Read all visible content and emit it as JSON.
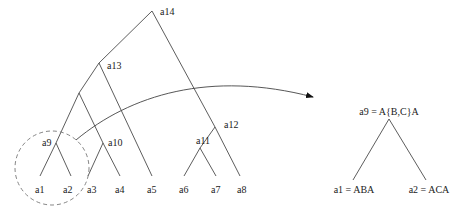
{
  "tree": {
    "internal_nodes": [
      {
        "id": "a14",
        "label": "a14"
      },
      {
        "id": "a13",
        "label": "a13"
      },
      {
        "id": "a12",
        "label": "a12"
      },
      {
        "id": "a11",
        "label": "a11"
      },
      {
        "id": "a10",
        "label": "a10"
      },
      {
        "id": "a9",
        "label": "a9"
      }
    ],
    "leaves": [
      {
        "id": "a1",
        "label": "a1"
      },
      {
        "id": "a2",
        "label": "a2"
      },
      {
        "id": "a3",
        "label": "a3"
      },
      {
        "id": "a4",
        "label": "a4"
      },
      {
        "id": "a5",
        "label": "a5"
      },
      {
        "id": "a6",
        "label": "a6"
      },
      {
        "id": "a7",
        "label": "a7"
      },
      {
        "id": "a8",
        "label": "a8"
      }
    ]
  },
  "detail": {
    "root_label": "a9 = A{B,C}A",
    "left_label": "a1 = ABA",
    "right_label": "a2 = ACA"
  },
  "colors": {
    "line": "#333333",
    "dashed_circle": "#777777",
    "text": "#222222"
  }
}
